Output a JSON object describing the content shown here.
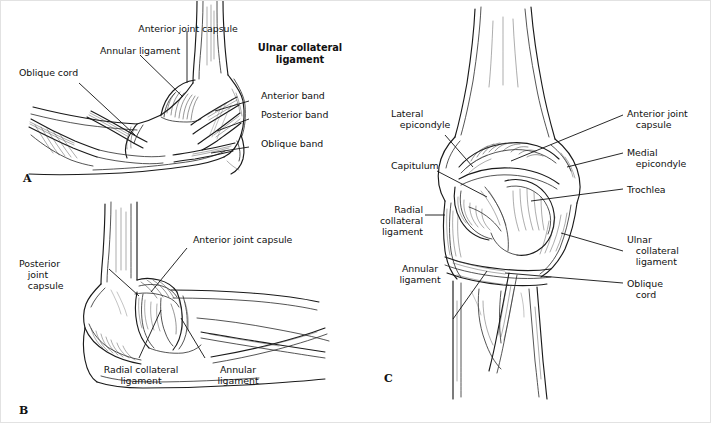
{
  "figure": {
    "background": "#ffffff",
    "line_color": "#111111"
  },
  "panels": [
    {
      "id": "A",
      "letter": "A",
      "view": "lateral-view-elbow-ligaments",
      "emphasis_label": "Ulnar collateral\nligament",
      "labels": [
        {
          "name": "anterior-joint-capsule",
          "text": "Anterior joint capsule",
          "align": "center"
        },
        {
          "name": "annular-ligament",
          "text": "Annular ligament",
          "align": "center"
        },
        {
          "name": "oblique-cord",
          "text": "Oblique cord",
          "align": "left"
        },
        {
          "name": "anterior-band",
          "text": "Anterior band",
          "align": "left"
        },
        {
          "name": "posterior-band",
          "text": "Posterior band",
          "align": "left"
        },
        {
          "name": "oblique-band",
          "text": "Oblique band",
          "align": "left"
        }
      ]
    },
    {
      "id": "B",
      "letter": "B",
      "view": "posterolateral-view-elbow-ligaments",
      "labels": [
        {
          "name": "anterior-joint-capsule",
          "text": "Anterior joint capsule",
          "align": "left"
        },
        {
          "name": "posterior-joint-capsule",
          "text": "Posterior\n   joint\n   capsule",
          "align": "left"
        },
        {
          "name": "radial-collateral-ligament",
          "text": "Radial collateral\nligament",
          "align": "center"
        },
        {
          "name": "annular-ligament",
          "text": "Annular\nligament",
          "align": "center"
        }
      ]
    },
    {
      "id": "C",
      "letter": "C",
      "view": "anterior-view-elbow-ligaments",
      "labels": [
        {
          "name": "lateral-epicondyle",
          "text": "Lateral\n   epicondyle",
          "align": "left"
        },
        {
          "name": "capitulum",
          "text": "Capitulum",
          "align": "left"
        },
        {
          "name": "radial-collateral-ligament",
          "text": "Radial\ncollateral\nligament",
          "align": "right"
        },
        {
          "name": "annular-ligament",
          "text": "Annular\nligament",
          "align": "center"
        },
        {
          "name": "anterior-joint-capsule",
          "text": "Anterior joint\n   capsule",
          "align": "left"
        },
        {
          "name": "medial-epicondyle",
          "text": "Medial\n   epicondyle",
          "align": "left"
        },
        {
          "name": "trochlea",
          "text": "Trochlea",
          "align": "left"
        },
        {
          "name": "ulnar-collateral-ligament",
          "text": "Ulnar\n   collateral\n   ligament",
          "align": "left"
        },
        {
          "name": "oblique-cord",
          "text": "Oblique\n   cord",
          "align": "left"
        }
      ]
    }
  ]
}
